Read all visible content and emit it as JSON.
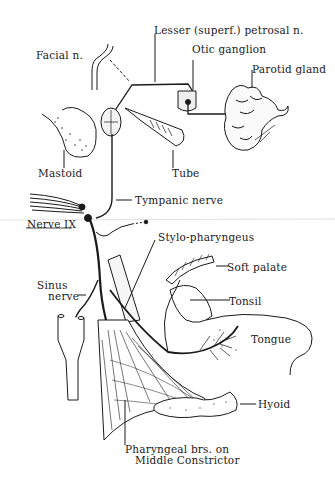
{
  "diagram": {
    "labels": {
      "facial_n": "Facial n.",
      "lesser_petrosal": "Lesser (superf.) petrosal n.",
      "otic_ganglion": "Otic ganglion",
      "parotid_gland": "Parotid gland",
      "mastoid": "Mastoid",
      "tube": "Tube",
      "tympanic_nerve": "Tympanic nerve",
      "nerve_ix": "Nerve IX",
      "stylo_pharyngeus": "Stylo-pharyngeus",
      "soft_palate": "Soft palate",
      "sinus_nerve_1": "Sinus",
      "sinus_nerve_2": "nerve",
      "tonsil": "Tonsil",
      "tongue": "Tongue",
      "hyoid": "Hyoid",
      "pharyngeal_1": "Pharyngeal brs. on",
      "pharyngeal_2": "Middle Constrictor"
    },
    "colors": {
      "ink": "#1a1a1a",
      "background": "#ffffff",
      "stipple": "#444444"
    }
  }
}
